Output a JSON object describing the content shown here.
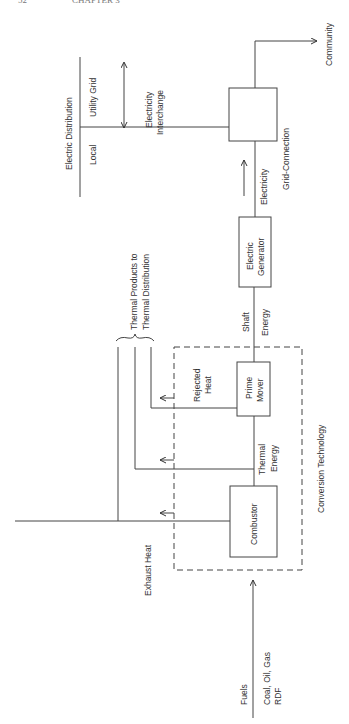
{
  "header": {
    "page_number": "52",
    "chapter": "CHAPTER 3"
  },
  "diagram": {
    "orientation": "rotated 90° counter-clockwise",
    "nodes": {
      "combustor": "Combustor",
      "prime_mover": [
        "Prime",
        "Mover"
      ],
      "electric_generator": [
        "Electric",
        "Generator"
      ],
      "grid_connection_box_label": "Grid-Connection"
    },
    "groups": {
      "conversion_technology": "Conversion Technology",
      "electric_distribution": "Electric Distribution"
    },
    "labels": {
      "fuels": "Fuels",
      "fuel_types": [
        "Coal, Oil, Gas",
        "RDF"
      ],
      "exhaust_heat": "Exhaust Heat",
      "thermal_energy": [
        "Thermal",
        "Energy"
      ],
      "rejected_heat": [
        "Rejected",
        "Heat"
      ],
      "shaft_energy": [
        "Shaft",
        "Energy"
      ],
      "electricity": "Electricity",
      "thermal_products": [
        "Thermal Products to",
        "Thermal Distribution"
      ],
      "local": "Local",
      "utility_grid": "Utility Grid",
      "electricity_interchange": [
        "Electricity",
        "Interchange"
      ],
      "community": "Community"
    },
    "edges": [
      {
        "from": "Fuels",
        "to": "Combustor"
      },
      {
        "from": "Combustor",
        "to": "Prime Mover",
        "label": "Thermal Energy"
      },
      {
        "from": "Prime Mover",
        "to": "Electric Generator",
        "label": "Shaft Energy"
      },
      {
        "from": "Electric Generator",
        "to": "Grid-Connection",
        "label": "Electricity"
      },
      {
        "from": "Grid-Connection",
        "to": "Community"
      },
      {
        "from": "Grid-Connection",
        "to": "Electric Distribution",
        "label": "Electricity Interchange",
        "bidirectional": true
      },
      {
        "from": "Combustor",
        "to": "Thermal Distribution",
        "label": "Exhaust Heat"
      },
      {
        "from": "Combustor/Prime Mover",
        "to": "Thermal Distribution",
        "label": "Thermal Energy"
      },
      {
        "from": "Prime Mover",
        "to": "Thermal Distribution",
        "label": "Rejected Heat"
      }
    ]
  }
}
